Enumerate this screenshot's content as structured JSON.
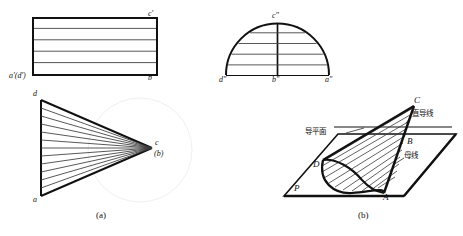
{
  "figure": {
    "title": "",
    "captions": {
      "left": "(a)",
      "right": "(b)"
    },
    "views": {
      "front_view": {
        "name": "front-projection-rectangle",
        "labels": {
          "top_right": "c'",
          "bottom_left": "a'(d')",
          "bottom_right": "b'"
        },
        "internal_line_count": 4
      },
      "side_view": {
        "name": "side-projection-semicircle",
        "labels": {
          "apex": "c\"",
          "left": "d\"",
          "center": "b\"",
          "right": "a\""
        },
        "internal_chord_count": 4
      },
      "top_view": {
        "name": "top-projection-fan",
        "labels": {
          "top_left": "d",
          "bottom_left": "a",
          "apex": "c",
          "apex_sub": "(b)"
        },
        "generatrix_count": 12
      },
      "pictorial": {
        "name": "3d-conoid-pictorial",
        "labels": {
          "apex_top": "C",
          "mid": "B",
          "base_left": "D",
          "base_right": "A",
          "plane": "P"
        },
        "annotations": {
          "guide_plane": "导平面",
          "straight_directrix": "直导线",
          "generatrix": "母线"
        }
      }
    },
    "colors": {
      "ink": "#111111",
      "thin_ink": "#333333",
      "paper": "#ffffff",
      "watermark": "#f2f2f2"
    }
  }
}
